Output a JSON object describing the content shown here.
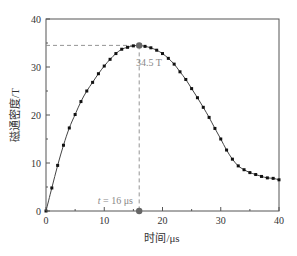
{
  "chart_data": {
    "type": "line",
    "title": "",
    "xlabel": "时间/μs",
    "ylabel": "磁通密度/T",
    "xlim": [
      0,
      40
    ],
    "ylim": [
      0,
      40
    ],
    "x_ticks": [
      0,
      10,
      20,
      30,
      40
    ],
    "y_ticks": [
      0,
      10,
      20,
      30,
      40
    ],
    "grid": false,
    "legend": null,
    "series": [
      {
        "name": "磁通密度",
        "marker": "square",
        "color": "#222222",
        "x": [
          0,
          1,
          2,
          3,
          4,
          5,
          6,
          7,
          8,
          9,
          10,
          11,
          12,
          13,
          14,
          15,
          16,
          17,
          18,
          19,
          20,
          21,
          22,
          23,
          24,
          25,
          26,
          27,
          28,
          29,
          30,
          31,
          32,
          33,
          34,
          35,
          36,
          37,
          38,
          39,
          40
        ],
        "values": [
          0,
          4.8,
          9.5,
          13.7,
          17.3,
          20.1,
          22.8,
          25.0,
          26.8,
          28.6,
          30.2,
          31.6,
          32.8,
          33.7,
          34.1,
          34.4,
          34.5,
          34.3,
          34.0,
          33.5,
          32.8,
          31.8,
          30.6,
          29.0,
          27.4,
          25.5,
          23.6,
          21.6,
          19.5,
          17.2,
          15.0,
          12.7,
          10.8,
          9.4,
          8.6,
          8.0,
          7.6,
          7.2,
          6.9,
          6.8,
          6.5
        ]
      }
    ],
    "annotations": [
      {
        "text": "34.5 T",
        "x": 16,
        "y": 34.5,
        "type": "peak-label"
      },
      {
        "text": "t = 16 μs",
        "x": 16,
        "y": 0,
        "type": "x-marker-label"
      }
    ],
    "reference_lines": {
      "horizontal_y": 34.5,
      "vertical_x": 16,
      "color": "#888888",
      "style": "dashed"
    },
    "highlight_color": "#666666"
  },
  "labels": {
    "xlabel": "时间/μs",
    "ylabel": "磁通密度/T",
    "peak": "34.5 T",
    "time_prefix": "t",
    "time_suffix": " = 16 μs"
  }
}
